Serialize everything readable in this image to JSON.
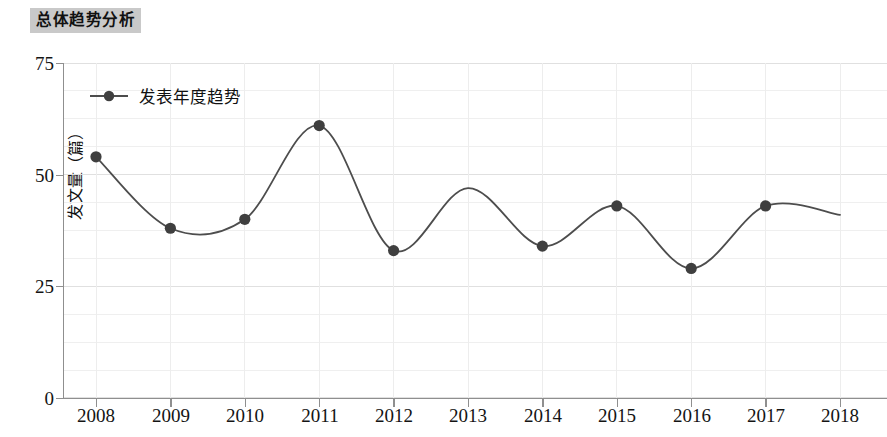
{
  "title": "总体趋势分析",
  "legend": {
    "label": "发表年度趋势"
  },
  "axes": {
    "y_title": "发文量（篇）",
    "y_ticks": [
      "0",
      "25",
      "50",
      "75"
    ],
    "x_ticks": [
      "2008",
      "2009",
      "2010",
      "2011",
      "2012",
      "2013",
      "2014",
      "2015",
      "2016",
      "2017",
      "2018"
    ]
  },
  "colors": {
    "line": "#4d4d4d",
    "marker": "#3f3f3f",
    "grid": "#e4e4e4",
    "axis": "#8a8a8a",
    "title_bg": "#c9c9c9"
  },
  "chart_data": {
    "type": "line",
    "title": "总体趋势分析",
    "xlabel": "",
    "ylabel": "发文量（篇）",
    "categories": [
      2008,
      2009,
      2010,
      2011,
      2012,
      2013,
      2014,
      2015,
      2016,
      2017,
      2018
    ],
    "series": [
      {
        "name": "发表年度趋势",
        "values": [
          54,
          38,
          40,
          61,
          33,
          47,
          34,
          43,
          29,
          43,
          41
        ],
        "markers": [
          true,
          true,
          true,
          true,
          true,
          false,
          true,
          true,
          true,
          true,
          false
        ]
      }
    ],
    "ylim": [
      0,
      75
    ],
    "yticks": [
      0,
      25,
      50,
      75
    ],
    "xlim": [
      2008,
      2018
    ],
    "grid": true,
    "minor_grid": true,
    "legend_position": "top-left",
    "smoothing": "spline"
  }
}
